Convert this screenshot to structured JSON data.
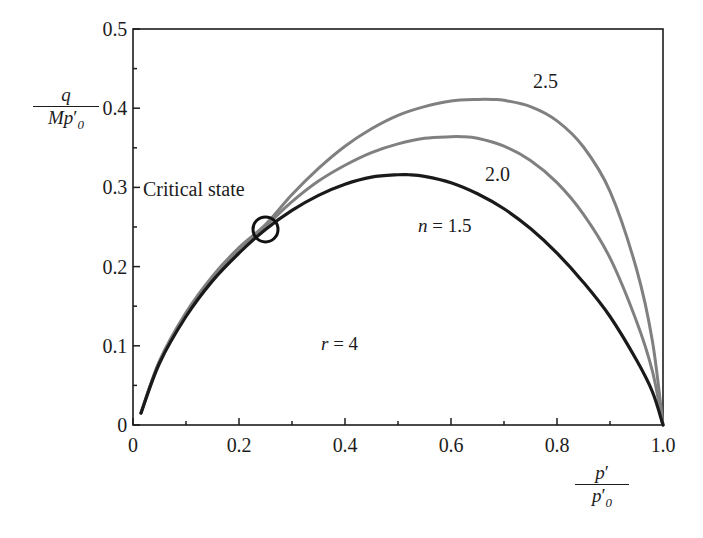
{
  "chart_data": {
    "type": "line",
    "title": "",
    "xlabel": "p'/p'0",
    "ylabel": "q/Mp'0",
    "xlim": [
      0,
      1.0
    ],
    "ylim": [
      0,
      0.5
    ],
    "grid": false,
    "legend_position": "inline-curve-labels",
    "x_ticks": [
      "0",
      "0.2",
      "0.4",
      "0.6",
      "0.8",
      "1.0"
    ],
    "x_tick_values": [
      0,
      0.2,
      0.4,
      0.6,
      0.8,
      1.0
    ],
    "x_minor_tick_values": [
      0.1,
      0.3,
      0.5,
      0.7,
      0.9
    ],
    "y_ticks": [
      "0",
      "0.1",
      "0.2",
      "0.3",
      "0.4",
      "0.5"
    ],
    "y_tick_values": [
      0,
      0.1,
      0.2,
      0.3,
      0.4,
      0.5
    ],
    "y_minor_tick_values": [
      0.05,
      0.15,
      0.25,
      0.35,
      0.45
    ],
    "series": [
      {
        "name": "n = 1.5",
        "label": "n = 1.5",
        "color": "#1a1a1a",
        "x": [
          0.015,
          0.05,
          0.1,
          0.15,
          0.2,
          0.25,
          0.3,
          0.35,
          0.4,
          0.45,
          0.5,
          0.52,
          0.55,
          0.6,
          0.65,
          0.7,
          0.75,
          0.8,
          0.85,
          0.9,
          0.95,
          0.98,
          1.0
        ],
        "y": [
          0.015,
          0.078,
          0.137,
          0.182,
          0.217,
          0.247,
          0.271,
          0.29,
          0.304,
          0.313,
          0.316,
          0.316,
          0.314,
          0.306,
          0.292,
          0.273,
          0.248,
          0.217,
          0.18,
          0.137,
          0.082,
          0.042,
          0.0
        ]
      },
      {
        "name": "2.0",
        "label": "2.0",
        "color": "#808080",
        "x": [
          0.015,
          0.05,
          0.1,
          0.15,
          0.2,
          0.25,
          0.3,
          0.35,
          0.4,
          0.45,
          0.5,
          0.55,
          0.6,
          0.62,
          0.65,
          0.7,
          0.75,
          0.8,
          0.85,
          0.9,
          0.95,
          0.98,
          1.0
        ],
        "y": [
          0.015,
          0.08,
          0.14,
          0.186,
          0.222,
          0.251,
          0.282,
          0.308,
          0.328,
          0.344,
          0.355,
          0.362,
          0.364,
          0.364,
          0.362,
          0.352,
          0.334,
          0.306,
          0.266,
          0.211,
          0.131,
          0.068,
          0.0
        ]
      },
      {
        "name": "2.5",
        "label": "2.5",
        "color": "#808080",
        "x": [
          0.015,
          0.05,
          0.1,
          0.15,
          0.2,
          0.25,
          0.3,
          0.35,
          0.4,
          0.45,
          0.5,
          0.55,
          0.6,
          0.65,
          0.68,
          0.7,
          0.75,
          0.8,
          0.85,
          0.9,
          0.95,
          0.98,
          1.0
        ],
        "y": [
          0.015,
          0.081,
          0.142,
          0.188,
          0.224,
          0.253,
          0.291,
          0.324,
          0.352,
          0.374,
          0.391,
          0.402,
          0.409,
          0.411,
          0.411,
          0.41,
          0.402,
          0.384,
          0.351,
          0.295,
          0.197,
          0.106,
          0.0
        ]
      }
    ],
    "markers": [
      {
        "name": "critical-state-point",
        "label": "Critical state",
        "x": 0.25,
        "y": 0.247,
        "shape": "open-circle",
        "color": "#111111"
      }
    ],
    "annotations": [
      {
        "name": "r-annotation",
        "text": "r = 4",
        "x": 0.42,
        "y": 0.112
      }
    ]
  },
  "axis_labels": {
    "y": {
      "numerator": "q",
      "denominator_prefix": "Mp",
      "denominator_prime": "′",
      "denominator_sub": "0"
    },
    "x": {
      "numerator_base": "p",
      "numerator_prime": "′",
      "denominator_base": "p",
      "denominator_prime": "′",
      "denominator_sub": "0"
    }
  },
  "annotations": {
    "critical_state": "Critical state",
    "r_value_italic": "r",
    "r_value_rest": " = 4",
    "n_value_italic": "n",
    "n_value_rest": " = 1.5",
    "curve_2_0": "2.0",
    "curve_2_5": "2.5"
  },
  "ticks": {
    "y": [
      "0.5",
      "0.4",
      "0.3",
      "0.2",
      "0.1",
      "0"
    ],
    "x": [
      "0",
      "0.2",
      "0.4",
      "0.6",
      "0.8",
      "1.0"
    ]
  },
  "colors": {
    "axis": "#1c1c1c",
    "curve_black": "#1a1a1a",
    "curve_gray": "#808080",
    "text": "#1c1c1c",
    "background": "#ffffff"
  }
}
